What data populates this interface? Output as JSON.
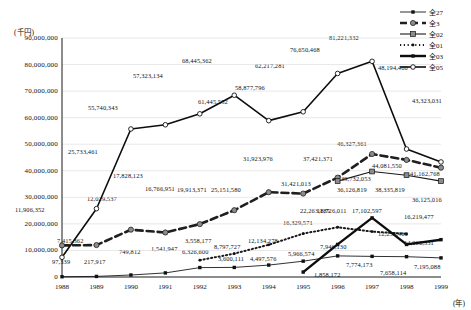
{
  "chart_data": {
    "type": "line",
    "title": "",
    "xlabel": "(年)",
    "ylabel": "(千円)",
    "x": [
      1988,
      1989,
      1990,
      1991,
      1992,
      1993,
      1994,
      1995,
      1996,
      1997,
      1998,
      1999
    ],
    "xticklabels": [
      "1988",
      "1989",
      "1990",
      "1991",
      "1992",
      "1993",
      "1994",
      "1995",
      "1996",
      "1997",
      "1998",
      "1999"
    ],
    "ylim": [
      0,
      90000000
    ],
    "yticks": [
      0,
      10000000,
      20000000,
      30000000,
      40000000,
      50000000,
      60000000,
      70000000,
      80000000,
      90000000
    ],
    "yticklabels": [
      "0",
      "10,000,000",
      "20,000,000",
      "30,000,000",
      "40,000,000",
      "50,000,000",
      "60,000,000",
      "70,000,000",
      "80,000,000",
      "90,000,000"
    ],
    "grid": true,
    "legend_position": "top-right",
    "series": [
      {
        "name": "全27",
        "style": "solid-thin",
        "marker": "square-small",
        "values": [
          97339,
          217917,
          749812,
          1541947,
          3558177,
          3600111,
          4497576,
          5966574,
          7946130,
          7774173,
          7658114,
          7195088
        ],
        "labels": [
          "97,339",
          "217,917",
          "749,812",
          "1,541,947",
          "3,558,177",
          "3,600,111",
          "4,497,576",
          "5,966,574",
          "7,946,130",
          "7,774,173",
          "7,658,114",
          "7,195,088"
        ]
      },
      {
        "name": "全3",
        "style": "dashed-thick",
        "marker": "circle-grey",
        "values": [
          11906352,
          12029537,
          17828123,
          16766951,
          19913371,
          25151580,
          31923976,
          31421013,
          37421371,
          46327361,
          44081550,
          41162768
        ],
        "labels": [
          "11,906,352",
          "12,029,537",
          "17,828,123",
          "16,766,951",
          "19,913,371",
          "25,151,580",
          "31,923,976",
          "31,421,013",
          "37,421,371",
          "46,327,361",
          "44,081,550",
          "41,162,768"
        ]
      },
      {
        "name": "全02",
        "style": "solid-medium",
        "marker": "square-grey",
        "values": [
          null,
          null,
          null,
          null,
          null,
          null,
          null,
          null,
          36126819,
          39732053,
          38335819,
          36125016
        ],
        "labels": [
          "",
          "",
          "",
          "",
          "",
          "",
          "",
          "",
          "36,126,819",
          "39,732,053",
          "38,335,819",
          "36,125,016"
        ]
      },
      {
        "name": "全01",
        "style": "dotted",
        "marker": "dot",
        "values": [
          null,
          null,
          null,
          null,
          6326600,
          8797727,
          12134278,
          16329571,
          18726011,
          17102597,
          16219477,
          null
        ],
        "labels": [
          "",
          "",
          "",
          "",
          "6,326,600",
          "8,797,727",
          "12,134,278",
          "16,329,571",
          "18,726,011",
          "17,102,597",
          "16,219,477",
          ""
        ]
      },
      {
        "name": "全03",
        "style": "solid-thin-arrow",
        "marker": "square-small",
        "values": [
          null,
          null,
          null,
          null,
          null,
          null,
          null,
          1858172,
          12258466,
          22263185,
          12258466,
          14060331
        ],
        "labels": [
          "",
          "",
          "",
          "",
          "",
          "",
          "",
          "1,858,172",
          "",
          "22,263,185",
          "",
          "14,060,331"
        ]
      },
      {
        "name": "全05",
        "style": "solid-bold",
        "marker": "circle-open",
        "values": [
          7415362,
          25733461,
          55740343,
          57323134,
          61445552,
          68445362,
          58877796,
          62217281,
          76650468,
          81221332,
          48194460,
          43323031
        ],
        "labels": [
          "7,415,362",
          "25,733,461",
          "55,740,343",
          "57,323,134",
          "61,445,552",
          "68,445,362",
          "58,877,796",
          "62,217,281",
          "76,650,468",
          "81,221,332",
          "48,194,460",
          "43,323,031"
        ]
      }
    ],
    "annotations": [
      {
        "text": "97,339",
        "x": 52,
        "y": 258
      },
      {
        "text": "217,917",
        "x": 84,
        "y": 258
      },
      {
        "text": "749,812",
        "x": 119,
        "y": 248
      },
      {
        "text": "1,541,947",
        "x": 151,
        "y": 245
      },
      {
        "text": "3,558,177",
        "x": 185,
        "y": 237
      },
      {
        "text": "3,600,111",
        "x": 218,
        "y": 255
      },
      {
        "text": "4,497,576",
        "x": 250,
        "y": 255
      },
      {
        "text": "5,966,574",
        "x": 288,
        "y": 250
      },
      {
        "text": "7,946,130",
        "x": 320,
        "y": 243
      },
      {
        "text": "7,774,173",
        "x": 346,
        "y": 261
      },
      {
        "text": "7,658,114",
        "x": 380,
        "y": 269
      },
      {
        "text": "7,195,088",
        "x": 414,
        "y": 263
      },
      {
        "text": "11,906,352",
        "x": 15,
        "y": 206
      },
      {
        "text": "12,029,537",
        "x": 87,
        "y": 195
      },
      {
        "text": "17,828,123",
        "x": 113,
        "y": 172
      },
      {
        "text": "16,766,951",
        "x": 145,
        "y": 185
      },
      {
        "text": "19,913,371",
        "x": 177,
        "y": 186
      },
      {
        "text": "25,151,580",
        "x": 211,
        "y": 186
      },
      {
        "text": "31,923,976",
        "x": 243,
        "y": 155
      },
      {
        "text": "31,421,013",
        "x": 281,
        "y": 180
      },
      {
        "text": "37,421,371",
        "x": 303,
        "y": 155
      },
      {
        "text": "46,327,361",
        "x": 337,
        "y": 140
      },
      {
        "text": "44,081,550",
        "x": 372,
        "y": 162
      },
      {
        "text": "41,162,768",
        "x": 410,
        "y": 170
      },
      {
        "text": "36,126,819",
        "x": 337,
        "y": 186
      },
      {
        "text": "39,732,053",
        "x": 341,
        "y": 175
      },
      {
        "text": "38,335,819",
        "x": 375,
        "y": 186
      },
      {
        "text": "36,125,016",
        "x": 412,
        "y": 196
      },
      {
        "text": "6,326,600",
        "x": 182,
        "y": 248
      },
      {
        "text": "8,797,727",
        "x": 214,
        "y": 243
      },
      {
        "text": "12,134,278",
        "x": 248,
        "y": 237
      },
      {
        "text": "16,329,571",
        "x": 283,
        "y": 219
      },
      {
        "text": "18,726,011",
        "x": 317,
        "y": 207
      },
      {
        "text": "17,102,597",
        "x": 352,
        "y": 207
      },
      {
        "text": "16,219,477",
        "x": 404,
        "y": 213
      },
      {
        "text": "22,263,185",
        "x": 300,
        "y": 207
      },
      {
        "text": "1,858,172",
        "x": 314,
        "y": 271
      },
      {
        "text": "12,258,466",
        "x": 378,
        "y": 230
      },
      {
        "text": "14,060,331",
        "x": 404,
        "y": 239
      },
      {
        "text": "7,415,362",
        "x": 57,
        "y": 237
      },
      {
        "text": "25,733,461",
        "x": 68,
        "y": 148
      },
      {
        "text": "55,740,343",
        "x": 88,
        "y": 104
      },
      {
        "text": "57,323,134",
        "x": 133,
        "y": 72
      },
      {
        "text": "61,445,552",
        "x": 198,
        "y": 98
      },
      {
        "text": "68,445,362",
        "x": 182,
        "y": 57
      },
      {
        "text": "58,877,796",
        "x": 235,
        "y": 84
      },
      {
        "text": "62,217,281",
        "x": 255,
        "y": 62
      },
      {
        "text": "76,650,468",
        "x": 290,
        "y": 46
      },
      {
        "text": "81,221,332",
        "x": 329,
        "y": 34
      },
      {
        "text": "48,194,460",
        "x": 378,
        "y": 64
      },
      {
        "text": "43,323,031",
        "x": 412,
        "y": 97
      }
    ]
  }
}
